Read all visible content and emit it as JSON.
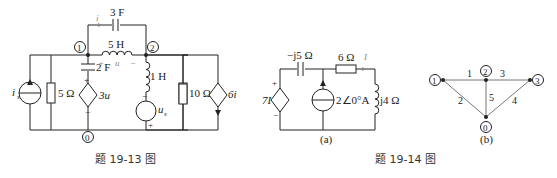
{
  "fig13": {
    "caption": "题 19-13 图",
    "nodes": {
      "n1": "1",
      "n2": "2",
      "n0": "0"
    },
    "components": {
      "is": "i",
      "is_sub": "s",
      "r5": "5 Ω",
      "c2": "2 F",
      "dep_v": "3u",
      "c3": "3 F",
      "l5": "5 H",
      "l1": "1 H",
      "us": "u",
      "us_sub": "s",
      "r10": "10 Ω",
      "dep_i": "6i"
    },
    "annotations": {
      "current_i": "i",
      "voltage_u": "u",
      "plus": "+",
      "minus": "−"
    }
  },
  "fig14": {
    "caption": "题 19-14 图",
    "sub_a": {
      "label": "(a)",
      "components": {
        "cap": "−j5 Ω",
        "res": "6 Ω",
        "current": "I",
        "dep_v": "7I",
        "src": "2∠0°A",
        "ind": "j4 Ω"
      }
    },
    "sub_b": {
      "label": "(b)",
      "nodes": [
        "1",
        "2",
        "3",
        "0"
      ],
      "branches": [
        "1",
        "2",
        "3",
        "4",
        "5"
      ]
    }
  }
}
